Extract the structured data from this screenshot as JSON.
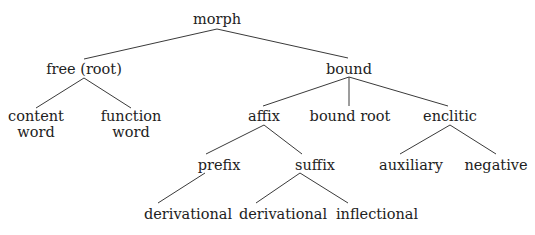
{
  "diagram": {
    "type": "tree",
    "nodes": {
      "morph": {
        "label": "morph",
        "x": 218,
        "y": 10
      },
      "free": {
        "label": "free (root)",
        "x": 84,
        "y": 60
      },
      "bound": {
        "label": "bound",
        "x": 349,
        "y": 60
      },
      "content": {
        "line1": "content",
        "line2": "word",
        "x": 36,
        "y": 107
      },
      "function": {
        "line1": "function",
        "line2": "word",
        "x": 130,
        "y": 107
      },
      "affix": {
        "label": "affix",
        "x": 265,
        "y": 107
      },
      "bound_root": {
        "label": "bound root",
        "x": 350,
        "y": 107
      },
      "enclitic": {
        "label": "enclitic",
        "x": 450,
        "y": 107
      },
      "prefix": {
        "label": "prefix",
        "x": 219,
        "y": 157
      },
      "suffix": {
        "label": "suffix",
        "x": 315,
        "y": 157
      },
      "auxiliary": {
        "label": "auxiliary",
        "x": 410,
        "y": 157
      },
      "negative": {
        "label": "negative",
        "x": 496,
        "y": 157
      },
      "prefix_derivational": {
        "label": "derivational",
        "x": 188,
        "y": 205
      },
      "suffix_derivational": {
        "label": "derivational",
        "x": 283,
        "y": 205
      },
      "suffix_inflectional": {
        "label": "inflectional",
        "x": 377,
        "y": 205
      }
    },
    "edges": [
      [
        "morph",
        "free"
      ],
      [
        "morph",
        "bound"
      ],
      [
        "free",
        "content"
      ],
      [
        "free",
        "function"
      ],
      [
        "bound",
        "affix"
      ],
      [
        "bound",
        "bound_root"
      ],
      [
        "bound",
        "enclitic"
      ],
      [
        "affix",
        "prefix"
      ],
      [
        "affix",
        "suffix"
      ],
      [
        "enclitic",
        "auxiliary"
      ],
      [
        "enclitic",
        "negative"
      ],
      [
        "prefix",
        "prefix_derivational"
      ],
      [
        "suffix",
        "suffix_derivational"
      ],
      [
        "suffix",
        "suffix_inflectional"
      ]
    ],
    "edge_color": "#3a3a3a",
    "text_color": "#222222"
  }
}
